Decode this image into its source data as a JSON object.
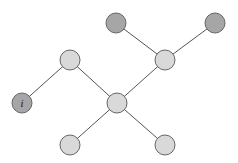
{
  "diagram": {
    "type": "tree-graph",
    "colors": {
      "dark_node": "#a6a6a6",
      "light_node": "#d9d9d9",
      "edge": "#555555",
      "stroke": "#666666"
    },
    "nodes": [
      {
        "id": "n_i",
        "label": "i",
        "x": 22,
        "y": 103,
        "r": 10,
        "shade": "dark"
      },
      {
        "id": "n_top_left",
        "label": "",
        "x": 116,
        "y": 23,
        "r": 10,
        "shade": "dark"
      },
      {
        "id": "n_top_right",
        "label": "",
        "x": 215,
        "y": 23,
        "r": 10,
        "shade": "dark"
      },
      {
        "id": "n_mid_left",
        "label": "",
        "x": 70,
        "y": 60,
        "r": 10,
        "shade": "light"
      },
      {
        "id": "n_mid_right",
        "label": "",
        "x": 165,
        "y": 60,
        "r": 10,
        "shade": "light"
      },
      {
        "id": "n_center",
        "label": "",
        "x": 117,
        "y": 103,
        "r": 10,
        "shade": "light"
      },
      {
        "id": "n_bottom_left",
        "label": "",
        "x": 70,
        "y": 145,
        "r": 10,
        "shade": "light"
      },
      {
        "id": "n_bottom_right",
        "label": "",
        "x": 165,
        "y": 145,
        "r": 10,
        "shade": "light"
      }
    ],
    "edges": [
      {
        "from": "n_i",
        "to": "n_mid_left"
      },
      {
        "from": "n_mid_left",
        "to": "n_center"
      },
      {
        "from": "n_center",
        "to": "n_mid_right"
      },
      {
        "from": "n_mid_right",
        "to": "n_top_left"
      },
      {
        "from": "n_mid_right",
        "to": "n_top_right"
      },
      {
        "from": "n_center",
        "to": "n_bottom_left"
      },
      {
        "from": "n_center",
        "to": "n_bottom_right"
      }
    ]
  }
}
